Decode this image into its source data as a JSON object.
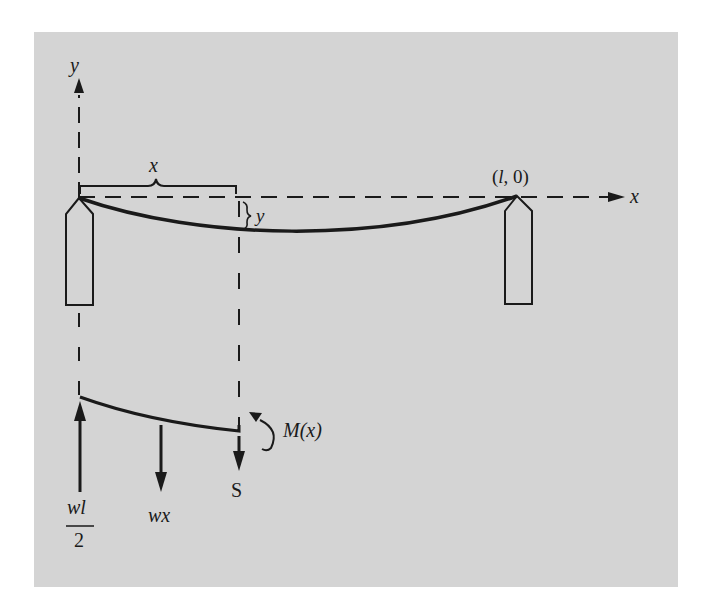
{
  "figure": {
    "type": "beam free-body diagram",
    "axes": {
      "y_label": "y",
      "x_label": "x"
    },
    "labels": {
      "span_x": "x",
      "deflection_y": "y",
      "end_point": "(l, 0)",
      "moment": "M(x)",
      "shear": "S",
      "distributed_load": "wx",
      "reaction_numerator": "wl",
      "reaction_denominator": "2"
    },
    "colors": {
      "background_panel": "#d4d4d4",
      "ink": "#1a1a1a"
    }
  }
}
